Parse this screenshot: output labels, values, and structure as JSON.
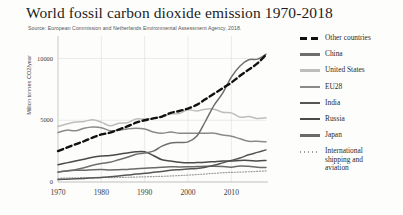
{
  "chart_data": {
    "type": "line",
    "title": "World fossil carbon dioxide emission 1970-2018",
    "subtitle": "Source: European Commission and Netherlands Environmental Assessment Agency, 2018.",
    "xlabel": "",
    "ylabel": "Million tonnes CO2/year",
    "xlim": [
      1970,
      2018
    ],
    "ylim": [
      0,
      11500
    ],
    "xticks": [
      "1970",
      "1980",
      "1990",
      "2000",
      "2010"
    ],
    "yticks": [
      "0",
      "5000",
      "10000"
    ],
    "grid": true,
    "legend_position": "right",
    "x": [
      1970,
      1972,
      1974,
      1976,
      1978,
      1980,
      1982,
      1984,
      1986,
      1988,
      1990,
      1992,
      1994,
      1996,
      1998,
      2000,
      2002,
      2004,
      2006,
      2008,
      2010,
      2012,
      2014,
      2016,
      2018
    ],
    "series": [
      {
        "name": "Other countries",
        "style": "dashed",
        "color": "#111111",
        "values": [
          2500,
          2780,
          3050,
          3300,
          3600,
          3850,
          4000,
          4250,
          4500,
          4800,
          5000,
          5150,
          5300,
          5600,
          5750,
          5950,
          6250,
          6700,
          7150,
          7600,
          8050,
          8600,
          9100,
          9600,
          10300
        ]
      },
      {
        "name": "China",
        "style": "solid",
        "color": "#6e6e6e",
        "values": [
          800,
          900,
          1000,
          1150,
          1350,
          1500,
          1600,
          1800,
          2000,
          2250,
          2350,
          2500,
          2900,
          3150,
          3200,
          3250,
          3700,
          4900,
          6200,
          7200,
          8500,
          9400,
          9900,
          9950,
          10350
        ]
      },
      {
        "name": "United States",
        "style": "solid",
        "color": "#bdbdbd",
        "values": [
          4500,
          4700,
          4850,
          4900,
          5050,
          4850,
          4550,
          4750,
          4800,
          5100,
          5100,
          5150,
          5300,
          5500,
          5550,
          5850,
          5750,
          5900,
          5900,
          5650,
          5600,
          5250,
          5300,
          5150,
          5200
        ]
      },
      {
        "name": "EU28",
        "style": "solid",
        "color": "#8a8a8a",
        "values": [
          4000,
          4200,
          4150,
          4350,
          4450,
          4400,
          4150,
          4200,
          4300,
          4350,
          4300,
          4050,
          3950,
          4050,
          3950,
          3950,
          3950,
          3950,
          3950,
          3800,
          3700,
          3500,
          3300,
          3300,
          3250
        ]
      },
      {
        "name": "India",
        "style": "solid",
        "color": "#555555",
        "values": [
          200,
          230,
          260,
          290,
          330,
          370,
          430,
          490,
          560,
          640,
          700,
          780,
          860,
          950,
          1000,
          1050,
          1100,
          1200,
          1350,
          1550,
          1750,
          1950,
          2200,
          2400,
          2600
        ]
      },
      {
        "name": "Russia",
        "style": "solid",
        "color": "#4a4a4a",
        "values": [
          1400,
          1550,
          1700,
          1850,
          2000,
          2100,
          2150,
          2250,
          2350,
          2450,
          2450,
          2150,
          1800,
          1700,
          1600,
          1550,
          1570,
          1600,
          1650,
          1700,
          1700,
          1750,
          1750,
          1700,
          1750
        ]
      },
      {
        "name": "Japan",
        "style": "solid",
        "color": "#6a6a6a",
        "values": [
          800,
          900,
          950,
          950,
          1000,
          1020,
          980,
          1000,
          1020,
          1080,
          1120,
          1150,
          1200,
          1230,
          1220,
          1230,
          1250,
          1270,
          1280,
          1250,
          1200,
          1300,
          1270,
          1200,
          1180
        ]
      },
      {
        "name": "International shipping and aviation",
        "style": "dotted",
        "color": "#9a9a9a",
        "values": [
          300,
          320,
          340,
          350,
          360,
          370,
          360,
          365,
          380,
          400,
          420,
          440,
          460,
          490,
          520,
          560,
          600,
          650,
          700,
          750,
          780,
          800,
          830,
          860,
          900
        ]
      }
    ]
  },
  "legend": {
    "items": [
      {
        "label": "Other countries"
      },
      {
        "label": "China"
      },
      {
        "label": "United States"
      },
      {
        "label": "EU28"
      },
      {
        "label": "India"
      },
      {
        "label": "Russia"
      },
      {
        "label": "Japan"
      },
      {
        "label": "International shipping and aviation"
      }
    ]
  }
}
